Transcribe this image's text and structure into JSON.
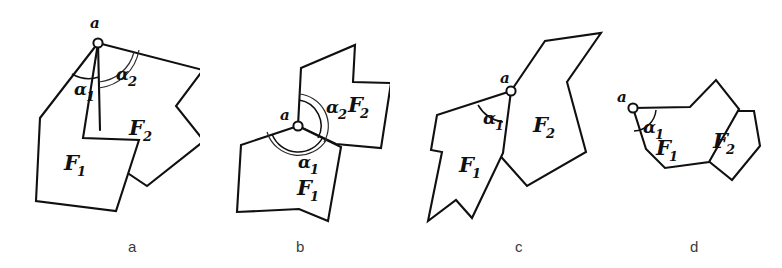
{
  "figure": {
    "background_color": "#ffffff",
    "ink_color": "#101010",
    "panels": [
      {
        "id": "a",
        "caption": "a",
        "vertex_label": "a",
        "region_labels": [
          "F",
          "F"
        ],
        "region_subscripts": [
          "1",
          "2"
        ],
        "angle_labels": [
          "α",
          "α"
        ],
        "angle_subscripts": [
          "1",
          "2"
        ],
        "angles_shown": 2,
        "description": "two convex-ish polygons sharing the top vertex, angles alpha1 and alpha2 both marked"
      },
      {
        "id": "b",
        "caption": "b",
        "vertex_label": "a",
        "region_labels": [
          "F",
          "F"
        ],
        "region_subscripts": [
          "1",
          "2"
        ],
        "angle_labels": [
          "α",
          "α"
        ],
        "angle_subscripts": [
          "1",
          "2"
        ],
        "angles_shown": 2,
        "description": "polygons meeting at a central vertex, alpha1 below and alpha2 above"
      },
      {
        "id": "c",
        "caption": "c",
        "vertex_label": "a",
        "region_labels": [
          "F",
          "F"
        ],
        "region_subscripts": [
          "1",
          "2"
        ],
        "angle_labels": [
          "α"
        ],
        "angle_subscripts": [
          "1"
        ],
        "angles_shown": 1,
        "description": "overlapping polygons with a notched left region, only alpha1 marked"
      },
      {
        "id": "d",
        "caption": "d",
        "vertex_label": "a",
        "region_labels": [
          "F",
          "F"
        ],
        "region_subscripts": [
          "1",
          "2"
        ],
        "angle_labels": [
          "α"
        ],
        "angle_subscripts": [
          "1"
        ],
        "angles_shown": 1,
        "description": "small pair of polygons, vertex a at the left, only alpha1 marked"
      }
    ]
  }
}
